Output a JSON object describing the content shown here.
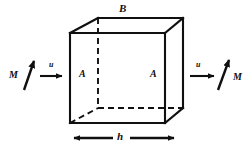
{
  "figure": {
    "type": "cube-control-volume-diagram",
    "caption": "",
    "colors": {
      "stroke": "#101010",
      "background": "#ffffff",
      "label": "#101010"
    },
    "labels": {
      "top_face": "B",
      "left_face": "A",
      "right_face": "A",
      "width_dimension": "h",
      "velocity_in": "u",
      "velocity_out": "u",
      "magnetization_in": "M",
      "magnetization_out": "M"
    },
    "geometry": {
      "front_face": {
        "top_left_x": 70,
        "top_left_y": 33,
        "top_right_x": 165,
        "top_right_y": 33,
        "bottom_right_x": 165,
        "bottom_right_y": 123,
        "bottom_left_x": 70,
        "bottom_left_y": 123
      },
      "back_face": {
        "top_left_x": 98,
        "top_left_y": 18,
        "top_right_x": 183,
        "top_right_y": 18,
        "bottom_right_x": 183,
        "bottom_right_y": 108,
        "bottom_left_x": 98,
        "bottom_left_y": 108
      },
      "hidden_edges": [
        "back-left-vertical",
        "back-bottom-horizontal",
        "bottom-left-depth"
      ],
      "dimension_arrow": {
        "x1": 72,
        "x2": 176,
        "y": 138
      }
    }
  }
}
